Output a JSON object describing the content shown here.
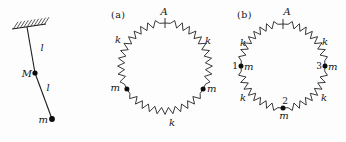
{
  "figure": {
    "pendulum": {
      "description": "double pendulum hanging from hatched ceiling",
      "labels": {
        "upper_rod": "l",
        "lower_rod": "l",
        "middle_mass": "M",
        "bottom_mass": "m"
      },
      "geometry": {
        "ceiling": {
          "x1": 12,
          "y1": 29,
          "x2": 46,
          "y2": 24,
          "hatch_count": 10,
          "hatch_dx": 4.5,
          "hatch_dy": -7
        },
        "pivot": [
          27,
          27
        ],
        "mid_mass": [
          35,
          73
        ],
        "end_mass": [
          52,
          119
        ],
        "mid_dot_r": 2.6,
        "end_dot_r": 2.9
      }
    },
    "ring_a": {
      "tag": "(a)",
      "fixed_point_label": "A",
      "spring_labels": [
        "k",
        "k",
        "k"
      ],
      "mass_labels": [
        "m",
        "m"
      ],
      "geometry": {
        "cx": 165,
        "cy": 67,
        "r": 44,
        "amp": 3.4,
        "arcs": [
          [
            -90,
            30
          ],
          [
            30,
            150
          ],
          [
            150,
            270
          ]
        ],
        "teeth": 11,
        "plain": 7,
        "mass_angles": [
          150,
          30
        ],
        "tick_angle": -90,
        "dot_r": 2.5
      }
    },
    "ring_b": {
      "tag": "(b)",
      "fixed_point_label": "A",
      "spring_labels": [
        "k",
        "k",
        "k",
        "k"
      ],
      "node_numbers": [
        "1",
        "2",
        "3"
      ],
      "mass_labels": [
        "m",
        "m",
        "m"
      ],
      "geometry": {
        "cx": 283,
        "cy": 66,
        "r": 42,
        "amp": 3.4,
        "arcs": [
          [
            -90,
            0
          ],
          [
            0,
            90
          ],
          [
            90,
            180
          ],
          [
            180,
            270
          ]
        ],
        "teeth": 8,
        "plain": 7,
        "mass_angles": [
          180,
          90,
          0
        ],
        "tick_angle": -90,
        "dot_r": 2.5
      }
    }
  }
}
